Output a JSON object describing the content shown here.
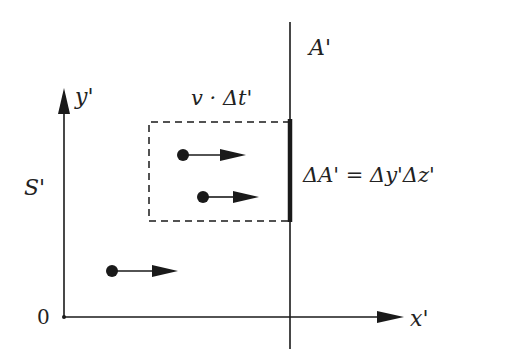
{
  "diagram": {
    "frame_label": "S'",
    "origin_label": "0",
    "axes": {
      "x_label": "x'",
      "y_label": "y'"
    },
    "surface": {
      "label": "A'",
      "element_equation": "ΔA' = Δy'Δz'"
    },
    "volume": {
      "label": "v · Δt'",
      "style": "dashed"
    },
    "particles": [
      {
        "id": 1,
        "inside_volume": true,
        "direction": "+x"
      },
      {
        "id": 2,
        "inside_volume": true,
        "direction": "+x"
      },
      {
        "id": 3,
        "inside_volume": false,
        "direction": "+x"
      }
    ],
    "colors": {
      "ink": "#1a1a1a",
      "background": "#ffffff"
    }
  }
}
